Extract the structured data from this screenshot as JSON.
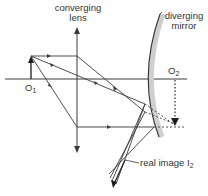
{
  "diagram": {
    "labels": {
      "lens_line1": "converging",
      "lens_line2": "lens",
      "mirror_line1": "diverging",
      "mirror_line2": "mirror",
      "object1": "O",
      "object1_sub": "1",
      "object2": "O",
      "object2_sub": "2",
      "image2": "real image I",
      "image2_sub": "2"
    },
    "colors": {
      "line": "#3a3a3a",
      "mirror_shade": "#c8c8c8",
      "text": "#333333"
    },
    "elements": {
      "principal_axis": "horizontal axis",
      "object_arrow": "O1 upright arrow",
      "lens": "converging lens (vertical line with arrowheads)",
      "mirror": "diverging (convex) mirror",
      "virtual_object": "O2 dotted image arrow",
      "real_image": "I2"
    }
  }
}
